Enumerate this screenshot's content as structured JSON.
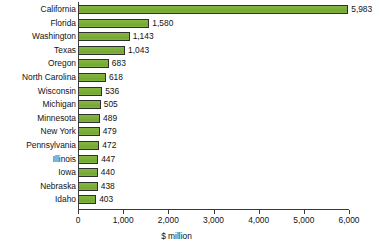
{
  "chart_data": {
    "type": "bar",
    "orientation": "horizontal",
    "title": "",
    "xlabel": "$ million",
    "ylabel": "",
    "xlim": [
      0,
      6000
    ],
    "xticks": [
      0,
      1000,
      2000,
      3000,
      4000,
      5000,
      6000
    ],
    "xtick_labels": [
      "0",
      "1,000",
      "2,000",
      "3,000",
      "4,000",
      "5,000",
      "6,000"
    ],
    "grid": false,
    "legend": null,
    "bar_color": "#7fb03c",
    "bar_border_color": "#2f2f2f",
    "background_color": "#ffffff",
    "categories": [
      "California",
      "Florida",
      "Washington",
      "Texas",
      "Oregon",
      "North Carolina",
      "Wisconsin",
      "Michigan",
      "Minnesota",
      "New York",
      "Pennsylvania",
      "Illinois",
      "Iowa",
      "Nebraska",
      "Idaho"
    ],
    "values": [
      5983,
      1580,
      1143,
      1043,
      683,
      618,
      536,
      505,
      489,
      479,
      472,
      447,
      440,
      438,
      403
    ],
    "value_labels": [
      "5,983",
      "1,580",
      "1,143",
      "1,043",
      "683",
      "618",
      "536",
      "505",
      "489",
      "479",
      "472",
      "447",
      "440",
      "438",
      "403"
    ]
  }
}
